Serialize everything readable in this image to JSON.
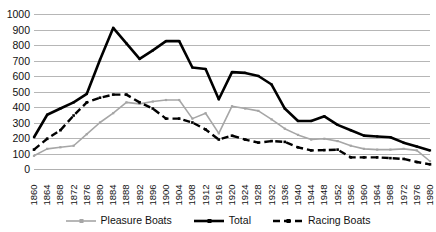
{
  "chart_data": {
    "type": "line",
    "title": "",
    "subtitle": "",
    "xlabel": "",
    "ylabel": "",
    "xlim": [
      1860,
      1980
    ],
    "ylim": [
      0,
      1000
    ],
    "grid": true,
    "legend_position": "bottom",
    "x": [
      1860,
      1864,
      1868,
      1872,
      1876,
      1880,
      1884,
      1888,
      1892,
      1896,
      1900,
      1904,
      1908,
      1912,
      1916,
      1920,
      1924,
      1928,
      1932,
      1936,
      1940,
      1944,
      1948,
      1952,
      1956,
      1960,
      1964,
      1968,
      1972,
      1976,
      1980
    ],
    "categories": [
      "1860",
      "1864",
      "1868",
      "1872",
      "1876",
      "1880",
      "1884",
      "1888",
      "1892",
      "1896",
      "1900",
      "1904",
      "1908",
      "1912",
      "1916",
      "1920",
      "1924",
      "1928",
      "1932",
      "1936",
      "1940",
      "1944",
      "1948",
      "1952",
      "1956",
      "1960",
      "1964",
      "1968",
      "1972",
      "1976",
      "1980"
    ],
    "yticks": [
      0,
      100,
      200,
      300,
      400,
      500,
      600,
      700,
      800,
      900,
      1000
    ],
    "ytick_labels": [
      "0",
      "100",
      "200",
      "300",
      "400",
      "500",
      "600",
      "700",
      "800",
      "900",
      "1000"
    ],
    "series": [
      {
        "name": "Pleasure Boats",
        "color": "#a6a6a6",
        "style": "solid",
        "width": 1.6,
        "values": [
          85,
          130,
          140,
          150,
          225,
          300,
          360,
          430,
          420,
          435,
          445,
          445,
          325,
          360,
          230,
          405,
          390,
          375,
          320,
          260,
          220,
          190,
          195,
          180,
          150,
          130,
          125,
          125,
          130,
          120,
          50
        ]
      },
      {
        "name": "Total",
        "color": "#000000",
        "style": "solid",
        "width": 2.6,
        "values": [
          205,
          350,
          390,
          430,
          485,
          705,
          910,
          810,
          710,
          765,
          825,
          825,
          655,
          645,
          450,
          625,
          620,
          600,
          545,
          390,
          310,
          310,
          340,
          285,
          250,
          215,
          210,
          205,
          170,
          145,
          120
        ]
      },
      {
        "name": "Racing Boats",
        "color": "#000000",
        "style": "dashed",
        "width": 2.4,
        "values": [
          125,
          195,
          250,
          345,
          430,
          460,
          480,
          480,
          430,
          390,
          325,
          325,
          300,
          255,
          190,
          215,
          190,
          170,
          180,
          175,
          140,
          120,
          122,
          125,
          75,
          75,
          75,
          70,
          65,
          45,
          30
        ]
      }
    ]
  },
  "legend": {
    "items": [
      {
        "label": "Pleasure Boats",
        "icon": "line-swatch-solid-gray"
      },
      {
        "label": "Total",
        "icon": "line-swatch-solid-black"
      },
      {
        "label": "Racing Boats",
        "icon": "line-swatch-dashed-black"
      }
    ]
  }
}
